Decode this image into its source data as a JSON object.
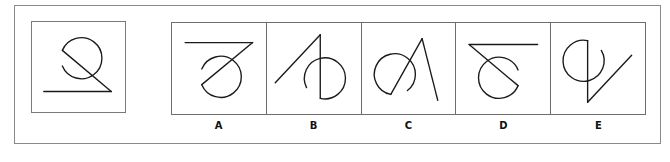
{
  "puzzle": {
    "question_figure": {
      "description": "circle (open arc) with diagonal line to baseline",
      "icon": "question-figure"
    },
    "options": [
      {
        "label": "A"
      },
      {
        "label": "B"
      },
      {
        "label": "C"
      },
      {
        "label": "D"
      },
      {
        "label": "E"
      }
    ]
  }
}
